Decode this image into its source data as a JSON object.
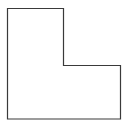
{
  "diagram": {
    "shape": "L-shape outline",
    "stroke_color": "#3a3a3a",
    "fill_color": "#ffffff",
    "points": "7.5,8.5 63.5,8.5 63.5,65.5 120.5,65.5 120.5,119 7.5,119"
  }
}
